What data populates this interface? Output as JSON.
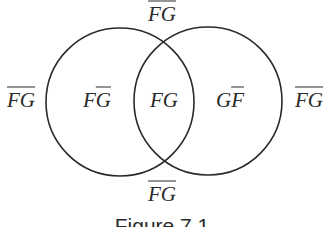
{
  "figure": {
    "caption": "Figure 7.1",
    "stroke_color": "#2a2a2a",
    "circles": [
      {
        "name": "F",
        "cx": 120,
        "cy": 102,
        "r": 74
      },
      {
        "name": "G",
        "cx": 208,
        "cy": 101,
        "r": 74
      }
    ],
    "regions": {
      "top_outside": {
        "p1": "F",
        "p1_bar": true,
        "p2": "G",
        "p2_bar": true
      },
      "left_outside": {
        "p1": "F",
        "p1_bar": true,
        "p2": "G",
        "p2_bar": true
      },
      "f_only": {
        "p1": "F",
        "p1_bar": false,
        "p2": "G",
        "p2_bar": true
      },
      "intersection": {
        "p1": "F",
        "p1_bar": false,
        "p2": "G",
        "p2_bar": false
      },
      "g_only": {
        "p1": "G",
        "p1_bar": false,
        "p2": "F",
        "p2_bar": true
      },
      "right_outside": {
        "p1": "F",
        "p1_bar": true,
        "p2": "G",
        "p2_bar": true
      },
      "bottom_outside": {
        "p1": "F",
        "p1_bar": true,
        "p2": "G",
        "p2_bar": true
      }
    }
  }
}
